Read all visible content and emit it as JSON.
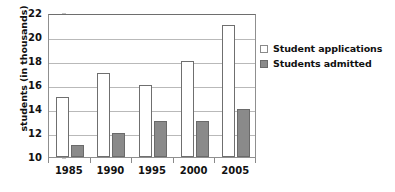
{
  "chart_data": {
    "type": "bar",
    "title": "",
    "subtitle": "",
    "xlabel": "",
    "ylabel": "students (in thousands)",
    "categories": [
      "1985",
      "1990",
      "1995",
      "2000",
      "2005"
    ],
    "series": [
      {
        "name": "Student applications",
        "color": "#ffffff",
        "values": [
          15,
          17,
          16,
          18,
          21
        ]
      },
      {
        "name": "Students admitted",
        "color": "#8a8a8a",
        "values": [
          11,
          12,
          13,
          13,
          14
        ]
      }
    ],
    "ylim": [
      10,
      22
    ],
    "ytick_values": [
      10,
      12,
      14,
      16,
      18,
      20,
      22
    ],
    "ytick_labels": [
      "10",
      "12",
      "14",
      "16",
      "18",
      "20",
      "22"
    ],
    "grid": true,
    "grid_axis": "y",
    "legend_position": "right",
    "annotations": []
  },
  "legend": {
    "items": [
      {
        "label": "Student applications",
        "swatch": "open-square-swatch"
      },
      {
        "label": "Students admitted",
        "swatch": "filled-square-swatch"
      }
    ]
  },
  "colors": {
    "applications_fill": "#ffffff",
    "applications_border": "#6f6f6f",
    "admitted_fill": "#8a8a8a",
    "admitted_border": "#6a6a6a",
    "gridline": "#b9b9b9",
    "axis": "#8f8f8f",
    "text": "#111111",
    "background": "#ffffff"
  }
}
